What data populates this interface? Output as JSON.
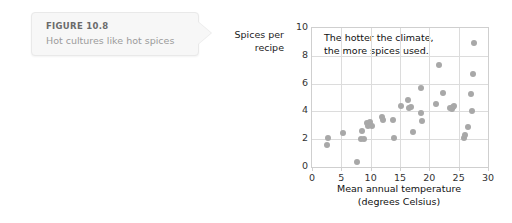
{
  "callout": {
    "figure_number": "FIGURE 10.8",
    "caption": "Hot cultures like hot spices"
  },
  "chart_labels": {
    "ylabel_line1": "Spices per",
    "ylabel_line2": "recipe"
  },
  "chart_data": {
    "type": "scatter",
    "title": "",
    "annotation": "The hotter the climate,\nthe more spices used.",
    "xlabel": "Mean annual temperature\n(degrees Celsius)",
    "xlabel_line1": "Mean annual temperature",
    "xlabel_line2": "(degrees Celsius)",
    "ylabel": "Spices per recipe",
    "xlim": [
      0,
      30
    ],
    "ylim": [
      0,
      10
    ],
    "xticks": [
      0,
      5,
      10,
      15,
      20,
      25,
      30
    ],
    "yticks": [
      0,
      2,
      4,
      6,
      8,
      10
    ],
    "grid": true,
    "legend": null,
    "marker_color": "#a8a8a8",
    "points": [
      [
        2.6,
        1.6
      ],
      [
        2.8,
        2.1
      ],
      [
        5.2,
        2.45
      ],
      [
        7.6,
        0.35
      ],
      [
        8.3,
        2.05
      ],
      [
        8.6,
        2.6
      ],
      [
        8.8,
        2.0
      ],
      [
        9.4,
        3.15
      ],
      [
        9.6,
        2.95
      ],
      [
        9.9,
        3.25
      ],
      [
        10.3,
        2.95
      ],
      [
        11.9,
        3.6
      ],
      [
        12.1,
        3.35
      ],
      [
        13.8,
        3.35
      ],
      [
        13.9,
        2.1
      ],
      [
        15.1,
        4.4
      ],
      [
        16.4,
        4.85
      ],
      [
        16.6,
        4.25
      ],
      [
        16.9,
        4.35
      ],
      [
        17.3,
        2.55
      ],
      [
        18.5,
        5.7
      ],
      [
        18.6,
        3.85
      ],
      [
        18.7,
        3.3
      ],
      [
        21.1,
        4.55
      ],
      [
        21.6,
        7.35
      ],
      [
        22.3,
        5.3
      ],
      [
        23.5,
        4.25
      ],
      [
        23.8,
        4.15
      ],
      [
        24.0,
        4.35
      ],
      [
        24.2,
        4.4
      ],
      [
        25.9,
        2.1
      ],
      [
        26.1,
        2.3
      ],
      [
        26.6,
        2.9
      ],
      [
        27.1,
        5.25
      ],
      [
        27.2,
        4.0
      ],
      [
        27.4,
        6.7
      ],
      [
        27.6,
        8.95
      ]
    ]
  }
}
